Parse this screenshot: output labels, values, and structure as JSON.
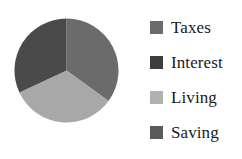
{
  "chart_data": {
    "type": "pie",
    "title": "",
    "subtitle": "",
    "xlabel": "",
    "ylabel": "",
    "grid": false,
    "legend_position": "right",
    "categories": [
      "Taxes",
      "Interest",
      "Living",
      "Saving"
    ],
    "values": [
      35,
      32,
      33,
      0
    ],
    "slices": [
      {
        "label": "Taxes",
        "value": 35,
        "percent": 35,
        "color": "#6b6b6b",
        "start_angle_deg": 0,
        "end_angle_deg": 126
      },
      {
        "label": "Living",
        "value": 33,
        "percent": 33,
        "color": "#a8a8a8",
        "start_angle_deg": 126,
        "end_angle_deg": 245
      },
      {
        "label": "Interest",
        "value": 32,
        "percent": 32,
        "color": "#4a4a4a",
        "start_angle_deg": 245,
        "end_angle_deg": 360
      },
      {
        "label": "Saving",
        "value": 0,
        "percent": 0,
        "color": "#5a5a5a",
        "start_angle_deg": 360,
        "end_angle_deg": 360
      }
    ],
    "geometry": {
      "center_x": 52.5,
      "center_y": 52.5,
      "radius": 52
    }
  },
  "legend": {
    "entries": [
      {
        "label": "Taxes",
        "color": "#6b6b6b"
      },
      {
        "label": "Interest",
        "color": "#3d3d3d"
      },
      {
        "label": "Living",
        "color": "#b0b0b0"
      },
      {
        "label": "Saving",
        "color": "#5a5a5a"
      }
    ]
  },
  "colors": {
    "background": "#ffffff",
    "text": "#1a1a1a",
    "taxes": "#6b6b6b",
    "interest": "#4a4a4a",
    "living": "#a8a8a8",
    "saving": "#5a5a5a"
  }
}
